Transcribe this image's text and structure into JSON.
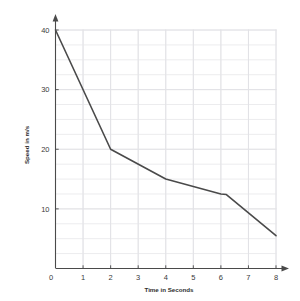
{
  "chart_data": {
    "type": "line",
    "title": "",
    "xlabel": "Time in Seconds",
    "ylabel": "Speed in m/s",
    "xlim": [
      0,
      8
    ],
    "ylim": [
      0,
      40
    ],
    "xticks": [
      0,
      1,
      2,
      3,
      4,
      5,
      6,
      7,
      8
    ],
    "xtick_labels": [
      "0",
      "1",
      "2",
      "3",
      "4",
      "5",
      "6",
      "7",
      "8"
    ],
    "yticks": [
      0,
      10,
      20,
      30,
      40
    ],
    "ytick_labels": [
      "0",
      "10",
      "20",
      "30",
      "40"
    ],
    "grid": true,
    "grid_minor_x_step": 1,
    "grid_minor_y_step": 2.5,
    "legend": "none",
    "origin_label": "0",
    "series": [
      {
        "name": "Speed",
        "x": [
          0,
          2,
          4,
          6,
          6.2,
          8
        ],
        "values": [
          40,
          20,
          15,
          12.5,
          12.4,
          5.5
        ],
        "color": "#4a4a4a",
        "line_width": 1.6,
        "markers": false
      }
    ]
  },
  "style": {
    "background": "#ffffff",
    "axis_color": "#4a4a4a",
    "grid_color": "#ececee",
    "grid_major_color": "#e2e2e6",
    "text_color": "#3a3a3a",
    "line_color": "#4a4a4a"
  },
  "axes": {
    "x_arrow": "arrow-right",
    "y_arrow": "arrow-up"
  }
}
